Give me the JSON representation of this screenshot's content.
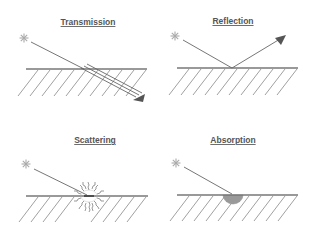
{
  "diagram": {
    "panels": [
      {
        "id": "transmission",
        "title": "Transmission",
        "process": "light ray passes through the surface",
        "ray": "incident",
        "arrow": "transmitted (parallel lines)"
      },
      {
        "id": "reflection",
        "title": "Reflection",
        "process": "light ray bounces off the surface",
        "ray": "incident",
        "arrow": "reflected"
      },
      {
        "id": "scattering",
        "title": "Scattering",
        "process": "light ray scattered in many directions at the surface",
        "ray": "incident",
        "arrow": "none"
      },
      {
        "id": "absorption",
        "title": "Absorption",
        "process": "light ray absorbed at the surface",
        "ray": "incident",
        "arrow": "none"
      }
    ],
    "icons": {
      "source": "light-source-star-icon"
    },
    "colors": {
      "lines": "#777777",
      "star": "#aaaaaa",
      "absorbed_spot": "#999999",
      "title": "#555555"
    }
  }
}
